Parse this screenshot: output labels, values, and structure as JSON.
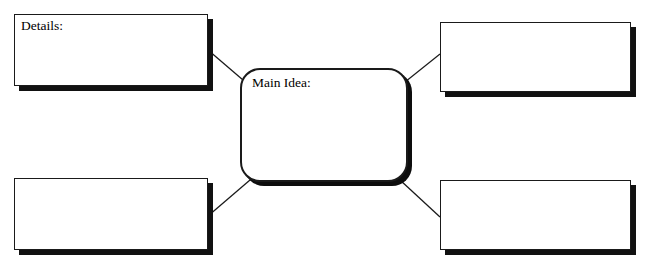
{
  "diagram": {
    "type": "main-idea-and-details-graphic-organizer",
    "center": {
      "label": "Main Idea:",
      "shape": "rounded-rectangle",
      "value": ""
    },
    "detail_boxes": [
      {
        "position": "top-left",
        "label": "Details:",
        "value": ""
      },
      {
        "position": "top-right",
        "label": "",
        "value": ""
      },
      {
        "position": "bottom-left",
        "label": "",
        "value": ""
      },
      {
        "position": "bottom-right",
        "label": "",
        "value": ""
      }
    ],
    "connectors": [
      {
        "from": "center",
        "to": "top-left"
      },
      {
        "from": "center",
        "to": "top-right"
      },
      {
        "from": "center",
        "to": "bottom-left"
      },
      {
        "from": "center",
        "to": "bottom-right"
      }
    ],
    "colors": {
      "background": "#ffffff",
      "stroke": "#1a1a1a",
      "shadow": "#111111",
      "text": "#000000"
    }
  }
}
